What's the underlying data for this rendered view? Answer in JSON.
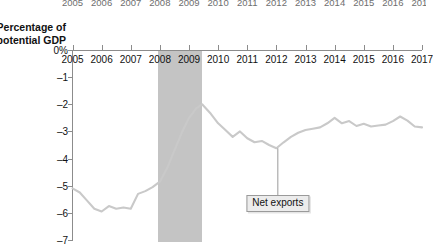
{
  "figure": {
    "axis_title": "Percentage of\npotential GDP",
    "cropped_year_row": [
      "2005",
      "2006",
      "2007",
      "2008",
      "2009",
      "2010",
      "2011",
      "2012",
      "2013",
      "2014",
      "2015",
      "2016",
      "2017"
    ],
    "colors": {
      "line": "#c9c9c9",
      "recession_band": "#c4c4c4",
      "axis": "#8c8c8c",
      "label_box_fill": "#ececec",
      "label_box_border": "#9a9a9a",
      "text": "#111111",
      "background": "#ffffff"
    },
    "annotations": [
      {
        "name": "net-exports",
        "label": "Net exports",
        "pointer_year": 2012.05,
        "pointer_value": -3.62,
        "box_year": 2012.05,
        "box_value": -5.35
      }
    ],
    "recession": {
      "label": "recession-shading",
      "start": 2007.95,
      "end": 2009.45
    }
  },
  "chart_data": {
    "type": "line",
    "title": "",
    "subtitle": "",
    "xlabel": "",
    "ylabel": "Percentage of potential GDP",
    "xlim": [
      2005,
      2017
    ],
    "ylim": [
      -7,
      0
    ],
    "grid": false,
    "legend": "none",
    "x_ticks": [
      2005,
      2006,
      2007,
      2008,
      2009,
      2010,
      2011,
      2012,
      2013,
      2014,
      2015,
      2016,
      2017
    ],
    "x_tick_labels": [
      "2005",
      "2006",
      "2007",
      "2008",
      "2009",
      "2010",
      "2011",
      "2012",
      "2013",
      "2014",
      "2015",
      "2016",
      "2017"
    ],
    "y_ticks": [
      0,
      -1,
      -2,
      -3,
      -4,
      -5,
      -6,
      -7
    ],
    "y_tick_labels": [
      "0%",
      "–1",
      "–2",
      "–3",
      "–4",
      "–5",
      "–6",
      "–7"
    ],
    "series": [
      {
        "name": "Net exports",
        "color": "#c9c9c9",
        "x": [
          2005.0,
          2005.25,
          2005.5,
          2005.75,
          2006.0,
          2006.25,
          2006.5,
          2006.75,
          2007.0,
          2007.25,
          2007.5,
          2007.75,
          2008.0,
          2008.25,
          2008.5,
          2008.75,
          2009.0,
          2009.25,
          2009.45,
          2009.75,
          2010.0,
          2010.25,
          2010.5,
          2010.75,
          2011.0,
          2011.25,
          2011.5,
          2011.75,
          2012.0,
          2012.25,
          2012.5,
          2012.75,
          2013.0,
          2013.25,
          2013.5,
          2013.75,
          2014.0,
          2014.25,
          2014.5,
          2014.75,
          2015.0,
          2015.25,
          2015.5,
          2015.75,
          2016.0,
          2016.25,
          2016.5,
          2016.75,
          2017.0
        ],
        "y": [
          -5.1,
          -5.25,
          -5.55,
          -5.85,
          -5.95,
          -5.75,
          -5.85,
          -5.8,
          -5.85,
          -5.3,
          -5.2,
          -5.05,
          -4.85,
          -4.35,
          -3.7,
          -3.05,
          -2.5,
          -2.15,
          -2.0,
          -2.35,
          -2.7,
          -2.95,
          -3.2,
          -3.0,
          -3.25,
          -3.4,
          -3.35,
          -3.5,
          -3.62,
          -3.4,
          -3.2,
          -3.05,
          -2.95,
          -2.9,
          -2.85,
          -2.7,
          -2.5,
          -2.7,
          -2.62,
          -2.8,
          -2.72,
          -2.82,
          -2.78,
          -2.75,
          -2.62,
          -2.45,
          -2.6,
          -2.82,
          -2.85
        ]
      }
    ]
  }
}
